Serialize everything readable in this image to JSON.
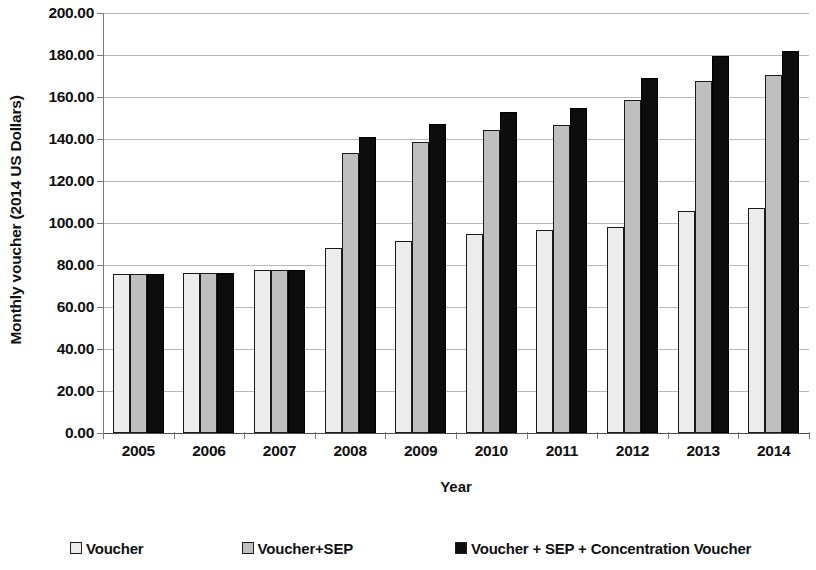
{
  "chart_data": {
    "type": "bar",
    "title": "",
    "xlabel": "Year",
    "ylabel": "Monthly voucher (2014 US Dollars)",
    "categories": [
      "2005",
      "2006",
      "2007",
      "2008",
      "2009",
      "2010",
      "2011",
      "2012",
      "2013",
      "2014"
    ],
    "series": [
      {
        "name": "Voucher",
        "color": "#ececec",
        "values": [
          75.5,
          76.0,
          77.5,
          88.0,
          91.5,
          95.0,
          96.5,
          98.0,
          105.5,
          107.0
        ]
      },
      {
        "name": "Voucher+SEP",
        "color": "#bfbfbf",
        "values": [
          75.5,
          76.0,
          77.5,
          133.5,
          138.5,
          144.5,
          146.5,
          158.5,
          167.5,
          170.5
        ]
      },
      {
        "name": "Voucher + SEP + Concentration Voucher",
        "color": "#0d0d0d",
        "values": [
          75.5,
          76.0,
          77.5,
          141.0,
          147.0,
          153.0,
          155.0,
          169.0,
          179.5,
          182.0
        ]
      }
    ],
    "ylim": [
      0,
      200
    ],
    "ytick_step": 20,
    "ytick_labels": [
      "0.00",
      "20.00",
      "40.00",
      "60.00",
      "80.00",
      "100.00",
      "120.00",
      "140.00",
      "160.00",
      "180.00",
      "200.00"
    ],
    "grid": true,
    "legend_position": "bottom"
  },
  "legend": {
    "items": [
      {
        "label": "Voucher",
        "color": "#ececec"
      },
      {
        "label": "Voucher+SEP",
        "color": "#bfbfbf"
      },
      {
        "label": "Voucher + SEP + Concentration Voucher",
        "color": "#0d0d0d"
      }
    ]
  }
}
